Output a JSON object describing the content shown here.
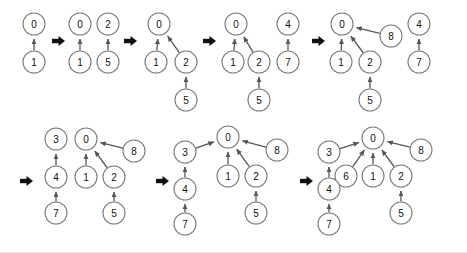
{
  "figure": {
    "title": "",
    "background_color": "#ffffff",
    "node_fill": "#ffffff",
    "node_stroke": "#7b7b7b",
    "edge_color": "#55555a",
    "label_color": "#111111",
    "arrow_color": "#111111",
    "node_radius": 11
  },
  "rows": [
    {
      "id": "row-1",
      "leading_arrow": false,
      "panels": [
        {
          "id": "step-1",
          "nodes": [
            {
              "label": "0",
              "x": 34,
              "y": 24
            },
            {
              "label": "1",
              "x": 34,
              "y": 62
            }
          ],
          "edges": [
            {
              "from": "1",
              "to": "0"
            }
          ]
        },
        {
          "id": "step-2",
          "nodes": [
            {
              "label": "0",
              "x": 80,
              "y": 24
            },
            {
              "label": "2",
              "x": 108,
              "y": 24
            },
            {
              "label": "1",
              "x": 80,
              "y": 62
            },
            {
              "label": "5",
              "x": 108,
              "y": 62
            }
          ],
          "edges": [
            {
              "from": "1",
              "to": "0"
            },
            {
              "from": "5",
              "to": "2"
            }
          ]
        },
        {
          "id": "step-3",
          "nodes": [
            {
              "label": "0",
              "x": 159,
              "y": 24
            },
            {
              "label": "1",
              "x": 156,
              "y": 62
            },
            {
              "label": "2",
              "x": 186,
              "y": 62
            },
            {
              "label": "5",
              "x": 186,
              "y": 100
            }
          ],
          "edges": [
            {
              "from": "1",
              "to": "0"
            },
            {
              "from": "2",
              "to": "0"
            },
            {
              "from": "5",
              "to": "2"
            }
          ]
        },
        {
          "id": "step-4",
          "nodes": [
            {
              "label": "0",
              "x": 236,
              "y": 24
            },
            {
              "label": "4",
              "x": 288,
              "y": 24
            },
            {
              "label": "1",
              "x": 233,
              "y": 62
            },
            {
              "label": "2",
              "x": 259,
              "y": 62
            },
            {
              "label": "7",
              "x": 288,
              "y": 62
            },
            {
              "label": "5",
              "x": 259,
              "y": 100
            }
          ],
          "edges": [
            {
              "from": "1",
              "to": "0"
            },
            {
              "from": "2",
              "to": "0"
            },
            {
              "from": "5",
              "to": "2"
            },
            {
              "from": "7",
              "to": "4"
            }
          ]
        },
        {
          "id": "step-5",
          "nodes": [
            {
              "label": "0",
              "x": 342,
              "y": 24
            },
            {
              "label": "8",
              "x": 391,
              "y": 36
            },
            {
              "label": "4",
              "x": 419,
              "y": 24
            },
            {
              "label": "1",
              "x": 341,
              "y": 62
            },
            {
              "label": "2",
              "x": 370,
              "y": 62
            },
            {
              "label": "7",
              "x": 419,
              "y": 62
            },
            {
              "label": "5",
              "x": 370,
              "y": 100
            }
          ],
          "edges": [
            {
              "from": "1",
              "to": "0"
            },
            {
              "from": "2",
              "to": "0"
            },
            {
              "from": "8",
              "to": "0"
            },
            {
              "from": "5",
              "to": "2"
            },
            {
              "from": "7",
              "to": "4"
            }
          ]
        }
      ],
      "step_arrows": [
        {
          "x": 52,
          "y": 41
        },
        {
          "x": 124,
          "y": 41
        },
        {
          "x": 203,
          "y": 41
        },
        {
          "x": 312,
          "y": 41
        }
      ]
    },
    {
      "id": "row-2",
      "leading_arrow": true,
      "panels": [
        {
          "id": "step-6",
          "nodes": [
            {
              "label": "3",
              "x": 56,
              "y": 139
            },
            {
              "label": "0",
              "x": 86,
              "y": 139
            },
            {
              "label": "8",
              "x": 134,
              "y": 151
            },
            {
              "label": "4",
              "x": 56,
              "y": 177
            },
            {
              "label": "1",
              "x": 86,
              "y": 177
            },
            {
              "label": "2",
              "x": 114,
              "y": 177
            },
            {
              "label": "7",
              "x": 56,
              "y": 213
            },
            {
              "label": "5",
              "x": 114,
              "y": 213
            }
          ],
          "edges": [
            {
              "from": "4",
              "to": "3"
            },
            {
              "from": "7",
              "to": "4"
            },
            {
              "from": "1",
              "to": "0"
            },
            {
              "from": "2",
              "to": "0"
            },
            {
              "from": "8",
              "to": "0"
            },
            {
              "from": "5",
              "to": "2"
            }
          ]
        },
        {
          "id": "step-7",
          "nodes": [
            {
              "label": "0",
              "x": 228,
              "y": 137
            },
            {
              "label": "3",
              "x": 185,
              "y": 152
            },
            {
              "label": "8",
              "x": 277,
              "y": 150
            },
            {
              "label": "1",
              "x": 228,
              "y": 176
            },
            {
              "label": "2",
              "x": 256,
              "y": 176
            },
            {
              "label": "4",
              "x": 185,
              "y": 189
            },
            {
              "label": "5",
              "x": 256,
              "y": 213
            },
            {
              "label": "7",
              "x": 185,
              "y": 224
            }
          ],
          "edges": [
            {
              "from": "3",
              "to": "0"
            },
            {
              "from": "4",
              "to": "3"
            },
            {
              "from": "7",
              "to": "4"
            },
            {
              "from": "1",
              "to": "0"
            },
            {
              "from": "2",
              "to": "0"
            },
            {
              "from": "8",
              "to": "0"
            },
            {
              "from": "5",
              "to": "2"
            }
          ]
        },
        {
          "id": "step-8",
          "nodes": [
            {
              "label": "0",
              "x": 373,
              "y": 138
            },
            {
              "label": "3",
              "x": 329,
              "y": 152
            },
            {
              "label": "8",
              "x": 421,
              "y": 150
            },
            {
              "label": "6",
              "x": 346,
              "y": 176
            },
            {
              "label": "1",
              "x": 373,
              "y": 176
            },
            {
              "label": "2",
              "x": 401,
              "y": 176
            },
            {
              "label": "4",
              "x": 329,
              "y": 189
            },
            {
              "label": "5",
              "x": 401,
              "y": 213
            },
            {
              "label": "7",
              "x": 329,
              "y": 224
            }
          ],
          "edges": [
            {
              "from": "3",
              "to": "0"
            },
            {
              "from": "6",
              "to": "0"
            },
            {
              "from": "4",
              "to": "3"
            },
            {
              "from": "7",
              "to": "4"
            },
            {
              "from": "1",
              "to": "0"
            },
            {
              "from": "2",
              "to": "0"
            },
            {
              "from": "8",
              "to": "0"
            },
            {
              "from": "5",
              "to": "2"
            }
          ]
        }
      ],
      "step_arrows": [
        {
          "x": 20,
          "y": 181
        },
        {
          "x": 156,
          "y": 181
        },
        {
          "x": 300,
          "y": 181
        }
      ]
    }
  ]
}
